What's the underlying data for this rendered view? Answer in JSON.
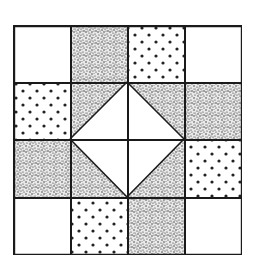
{
  "figure": {
    "title": "",
    "grid": {
      "rows": 4,
      "cols": 4
    },
    "fabrics": {
      "white": "#ffffff",
      "speckle": "speckled dark fabric",
      "dots": "white fabric with dark dots"
    },
    "colors": {
      "line": "#1a1a1a",
      "ink": "#222222",
      "background": "#ffffff"
    },
    "cells": [
      [
        "white",
        "speckle",
        "dots",
        "white"
      ],
      [
        "dots",
        "center-tl",
        "center-tr",
        "speckle"
      ],
      [
        "speckle",
        "center-bl",
        "center-br",
        "dots"
      ],
      [
        "white",
        "dots",
        "speckle",
        "white"
      ]
    ],
    "center": {
      "shape": "diamond",
      "fill": "white",
      "corner_fill": "speckle"
    }
  }
}
